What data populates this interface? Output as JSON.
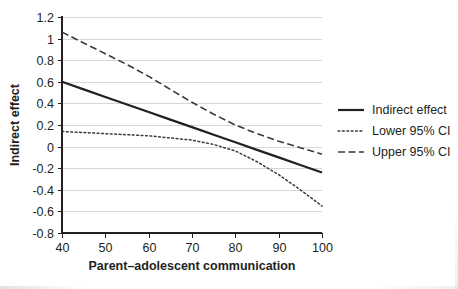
{
  "chart_data": {
    "type": "line",
    "title": "",
    "xlabel": "Parent–adolescent communication",
    "ylabel": "Indirect effect",
    "xlim": [
      40,
      100
    ],
    "ylim": [
      -0.8,
      1.2
    ],
    "xticks": [
      40,
      50,
      60,
      70,
      80,
      90,
      100
    ],
    "xtick_labels": [
      "40",
      "50",
      "60",
      "70",
      "80",
      "90",
      "100"
    ],
    "yticks": [
      -0.8,
      -0.6,
      -0.4,
      -0.2,
      0,
      0.2,
      0.4,
      0.6,
      0.8,
      1.0,
      1.2
    ],
    "ytick_labels": [
      "-0.8",
      "-0.6",
      "-0.4",
      "-0.2",
      "0",
      "0.2",
      "0.4",
      "0.6",
      "0.8",
      "1",
      "1.2"
    ],
    "grid": "horizontal",
    "legend_position": "right",
    "x": [
      40,
      45,
      50,
      55,
      60,
      65,
      70,
      75,
      80,
      85,
      90,
      95,
      100
    ],
    "series": [
      {
        "name": "Indirect effect",
        "style": "solid",
        "color": "#231f20",
        "width": 2.2,
        "values": [
          0.6,
          0.53,
          0.46,
          0.39,
          0.32,
          0.25,
          0.18,
          0.11,
          0.04,
          -0.03,
          -0.1,
          -0.17,
          -0.24
        ]
      },
      {
        "name": "Lower 95% CI",
        "style": "dotted",
        "color": "#3a3a3a",
        "width": 1.5,
        "values": [
          0.14,
          0.13,
          0.12,
          0.11,
          0.1,
          0.08,
          0.06,
          0.02,
          -0.04,
          -0.14,
          -0.26,
          -0.4,
          -0.55
        ]
      },
      {
        "name": "Upper 95% CI",
        "style": "dashed",
        "color": "#3a3a3a",
        "width": 1.6,
        "values": [
          1.06,
          0.96,
          0.86,
          0.76,
          0.65,
          0.53,
          0.41,
          0.3,
          0.2,
          0.12,
          0.05,
          -0.01,
          -0.07
        ]
      }
    ]
  },
  "legend": {
    "items": [
      {
        "label": "Indirect effect",
        "style": "solid"
      },
      {
        "label": "Lower 95% CI",
        "style": "dotted"
      },
      {
        "label": "Upper 95% CI",
        "style": "dashed"
      }
    ]
  }
}
